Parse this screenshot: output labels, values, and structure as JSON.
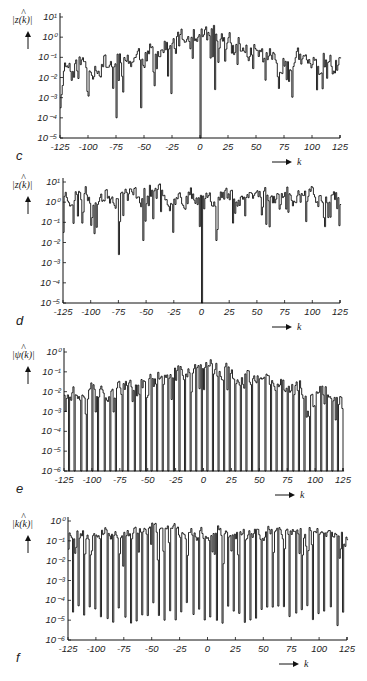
{
  "chart_data": [
    {
      "id": "c",
      "type": "line",
      "style": "step",
      "panel_label": "c",
      "ylabel": "|ẑ(k)|",
      "xlabel": "k",
      "xlim": [
        -125,
        125
      ],
      "ylim_exp": [
        -5,
        1
      ],
      "yscale": "log",
      "xticks": [
        -125,
        -100,
        -75,
        -50,
        -25,
        0,
        25,
        50,
        75,
        100,
        125
      ],
      "xtick_labels": [
        "-125",
        "-100",
        "-75",
        "-50",
        "-25",
        "0",
        "25",
        "50",
        "75",
        "100",
        "125"
      ],
      "ytick_labels": [
        "10^-5",
        "10^-4",
        "10^-3",
        "10^-2",
        "10^-1",
        "10^0",
        "10^1"
      ],
      "envelope": "peak ~10^0.3 near k=0, decaying to ~10^-1.5 at |k|=125",
      "deep_dips": [
        {
          "k": -75,
          "value_exp": -4.0
        },
        {
          "k": -53,
          "value_exp": -3.5
        },
        {
          "k": -26,
          "value_exp": -2.8
        },
        {
          "k": 0,
          "value_exp": -5
        },
        {
          "k": 13,
          "value_exp": -2.6
        },
        {
          "k": -125,
          "value_exp": -3.5
        }
      ],
      "seed": 11,
      "base_exp": -1.4,
      "center_exp": 0.2,
      "noise": 0.6,
      "gap_period": 0,
      "layout": {
        "x0": 60,
        "x1": 340,
        "y_top": 17,
        "y_bot": 138
      }
    },
    {
      "id": "d",
      "type": "line",
      "style": "step",
      "panel_label": "d",
      "ylabel": "|ẑ(k)|",
      "xlabel": "k",
      "xlim": [
        -125,
        125
      ],
      "ylim_exp": [
        -5,
        1
      ],
      "yscale": "log",
      "xticks": [
        -125,
        -100,
        -75,
        -50,
        -25,
        0,
        25,
        50,
        75,
        100,
        125
      ],
      "xtick_labels": [
        "-125",
        "-100",
        "-75",
        "-50",
        "-25",
        "0",
        "25",
        "50",
        "75",
        "100",
        "125"
      ],
      "ytick_labels": [
        "10^-5",
        "10^-4",
        "10^-3",
        "10^-2",
        "10^-1",
        "10^0",
        "10^1"
      ],
      "envelope": "flat ~10^0.4 across all k",
      "deep_dips": [
        {
          "k": -75,
          "value_exp": -2.6
        },
        {
          "k": -53,
          "value_exp": -1.9
        },
        {
          "k": -26,
          "value_exp": -1.5
        },
        {
          "k": 0,
          "value_exp": -5
        },
        {
          "k": 13,
          "value_exp": -1.9
        },
        {
          "k": -125,
          "value_exp": -1.5
        }
      ],
      "seed": 23,
      "base_exp": 0.35,
      "center_exp": 0.35,
      "noise": 0.5,
      "gap_period": 0,
      "layout": {
        "x0": 63,
        "x1": 340,
        "y_top": 182,
        "y_bot": 303
      }
    },
    {
      "id": "e",
      "type": "line",
      "style": "step-with-periodic-drops",
      "panel_label": "e",
      "ylabel": "|ψ̂(k)|",
      "xlabel": "k",
      "xlim": [
        -125,
        125
      ],
      "ylim_exp": [
        -6,
        0
      ],
      "yscale": "log",
      "xticks": [
        -125,
        -100,
        -75,
        -50,
        -25,
        0,
        25,
        50,
        75,
        100,
        125
      ],
      "xtick_labels": [
        "-125",
        "-100",
        "-75",
        "-50",
        "-25",
        "0",
        "25",
        "50",
        "75",
        "100",
        "125"
      ],
      "ytick_labels": [
        "10^-6",
        "10^-5",
        "10^-4",
        "10^-3",
        "10^-2",
        "10^-1",
        "10^0"
      ],
      "envelope": "peak ~10^-0.1 at k=0, decaying to ~10^-2 at |k|=125; drops to 10^-6 every ~4-5 k",
      "seed": 37,
      "base_exp": -2.0,
      "center_exp": -0.6,
      "noise": 0.45,
      "gap_period": 4.6,
      "gap_floor_exp": -6,
      "layout": {
        "x0": 64,
        "x1": 343,
        "y_top": 352,
        "y_bot": 471
      }
    },
    {
      "id": "f",
      "type": "line",
      "style": "step-with-periodic-drops",
      "panel_label": "f",
      "ylabel": "|k̂(k)|",
      "xlabel": "k",
      "xlim": [
        -125,
        125
      ],
      "ylim_exp": [
        -6,
        0
      ],
      "yscale": "log",
      "xticks": [
        -125,
        -100,
        -75,
        -50,
        -25,
        0,
        25,
        50,
        75,
        100,
        125
      ],
      "xtick_labels": [
        "-125",
        "-100",
        "-75",
        "-50",
        "-25",
        "0",
        "25",
        "50",
        "75",
        "100",
        "125"
      ],
      "ytick_labels": [
        "10^-6",
        "10^-5",
        "10^-4",
        "10^-3",
        "10^-2",
        "10^-1",
        "10^0"
      ],
      "envelope": "flat ~10^-0.7 across all k; periodic deep drops to 10^-4.5 .. 10^-6 every ~4-5 k",
      "seed": 53,
      "base_exp": -0.6,
      "center_exp": -0.6,
      "noise": 0.35,
      "gap_period": 4.6,
      "gap_floor_exp": -5.3,
      "layout": {
        "x0": 68,
        "x1": 347,
        "y_top": 521,
        "y_bot": 640
      }
    }
  ],
  "panels": [
    {
      "label": "c",
      "ylabel_main": "|z(k)|",
      "ylabel_hat": "^",
      "x_arrow_label": "k"
    },
    {
      "label": "d",
      "ylabel_main": "|z(k)|",
      "ylabel_hat": "^",
      "x_arrow_label": "k"
    },
    {
      "label": "e",
      "ylabel_main": "|ψ(k)|",
      "ylabel_hat": "^",
      "x_arrow_label": "k"
    },
    {
      "label": "f",
      "ylabel_main": "|k(k)|",
      "ylabel_hat": "^",
      "x_arrow_label": "k"
    }
  ]
}
